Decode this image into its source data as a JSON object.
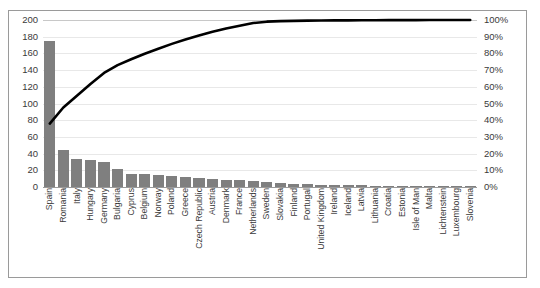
{
  "chart_data": {
    "type": "bar",
    "title": "",
    "xlabel": "",
    "ylabel": "",
    "y2label": "",
    "ylim": [
      0,
      200
    ],
    "y2lim": [
      0,
      100
    ],
    "grid": true,
    "legend": "none",
    "y_ticks": [
      "0",
      "20",
      "40",
      "60",
      "80",
      "100",
      "120",
      "140",
      "160",
      "180",
      "200"
    ],
    "y_tick_values": [
      0,
      20,
      40,
      60,
      80,
      100,
      120,
      140,
      160,
      180,
      200
    ],
    "y2_ticks": [
      "0%",
      "10%",
      "20%",
      "30%",
      "40%",
      "50%",
      "60%",
      "70%",
      "80%",
      "90%",
      "100%"
    ],
    "y2_tick_values": [
      0,
      10,
      20,
      30,
      40,
      50,
      60,
      70,
      80,
      90,
      100
    ],
    "categories": [
      "Spain",
      "Romania",
      "Italy",
      "Hungary",
      "Germany",
      "Bulgaria",
      "Cyprus",
      "Belgium",
      "Norway",
      "Poland",
      "Greece",
      "Czech Republic",
      "Austria",
      "Denmark",
      "France",
      "Netherlands",
      "Sweden",
      "Slovakia",
      "Finland",
      "Portugal",
      "United Kingdom",
      "Ireland",
      "Iceland",
      "Latvia",
      "Lithuania",
      "Croatia",
      "Estonia",
      "Isle of Man",
      "Malta",
      "Lichtenstein",
      "Luxembourg",
      "Slovenia"
    ],
    "series": [
      {
        "name": "Count",
        "type": "bar",
        "axis": "left",
        "color": "#7f7f7f",
        "values": [
          175,
          44,
          33,
          32,
          30,
          22,
          16,
          15,
          14,
          13,
          12,
          11,
          10,
          9,
          8,
          7,
          6,
          5,
          4,
          4,
          3,
          2,
          2,
          2,
          1,
          1,
          1,
          1,
          1,
          1,
          1,
          1
        ]
      },
      {
        "name": "Cumulative %",
        "type": "line",
        "axis": "right",
        "color": "#000000",
        "values": [
          38.0,
          47.6,
          54.7,
          61.7,
          68.3,
          73.0,
          76.5,
          79.8,
          82.8,
          85.7,
          88.3,
          90.7,
          92.9,
          94.9,
          96.6,
          98.2,
          99.0,
          99.3,
          99.5,
          99.6,
          99.7,
          99.75,
          99.8,
          99.85,
          99.88,
          99.9,
          99.92,
          99.94,
          99.96,
          99.97,
          99.99,
          100.0
        ]
      }
    ]
  },
  "frame": {
    "border_color": "#9a9a9a",
    "background": "#ffffff",
    "gridline_color": "#e8e8e8"
  }
}
